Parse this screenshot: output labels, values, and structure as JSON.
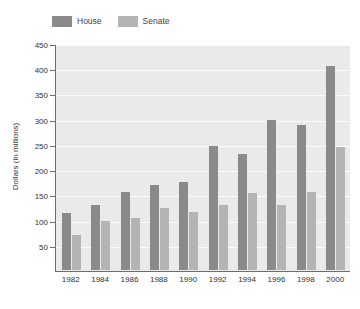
{
  "chart_data": {
    "type": "bar",
    "title": "",
    "xlabel": "",
    "ylabel": "Dollars (in millions)",
    "categories": [
      "1982",
      "1984",
      "1986",
      "1988",
      "1990",
      "1992",
      "1994",
      "1996",
      "1998",
      "2000"
    ],
    "series": [
      {
        "name": "House",
        "color": "#8a8a8a",
        "values": [
          113,
          128,
          155,
          168,
          175,
          245,
          230,
          298,
          288,
          405
        ]
      },
      {
        "name": "Senate",
        "color": "#b4b4b4",
        "values": [
          70,
          97,
          103,
          123,
          115,
          128,
          152,
          128,
          155,
          243
        ]
      }
    ],
    "ylim": [
      0,
      450
    ],
    "yticks": [
      50,
      100,
      150,
      200,
      250,
      300,
      350,
      400,
      450
    ],
    "ytick_labels": [
      "50",
      "100",
      "150",
      "200",
      "250",
      "300",
      "350",
      "400",
      "450"
    ],
    "grid": true,
    "grid_axis": "y",
    "legend_position": "top-left",
    "plot_background": "#eaeaea",
    "gridline_color": "#fbfbfb",
    "axis_color": "#6e6e6e"
  },
  "legend": {
    "entries": [
      {
        "label": "House",
        "color": "#8a8a8a"
      },
      {
        "label": "Senate",
        "color": "#b4b4b4"
      }
    ]
  },
  "footnote": {
    "text": ""
  }
}
